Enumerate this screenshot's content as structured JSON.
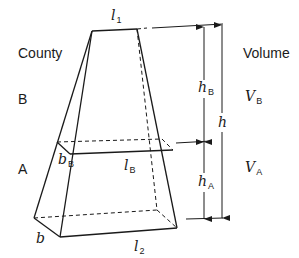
{
  "labels": {
    "county_header": "County",
    "volume_header": "Volume",
    "county_B": "B",
    "county_A": "A",
    "l1": {
      "main": "l",
      "sub": "1"
    },
    "l2": {
      "main": "l",
      "sub": "2"
    },
    "lB": {
      "main": "l",
      "sub": "B"
    },
    "bB": {
      "main": "b",
      "sub": "B"
    },
    "b": {
      "main": "b"
    },
    "hB": {
      "main": "h",
      "sub": "B"
    },
    "hA": {
      "main": "h",
      "sub": "A"
    },
    "h": {
      "main": "h"
    },
    "VB": {
      "main": "V",
      "sub": "B"
    },
    "VA": {
      "main": "V",
      "sub": "A"
    }
  },
  "colors": {
    "stroke": "#1a1a1a",
    "background": "#ffffff"
  }
}
